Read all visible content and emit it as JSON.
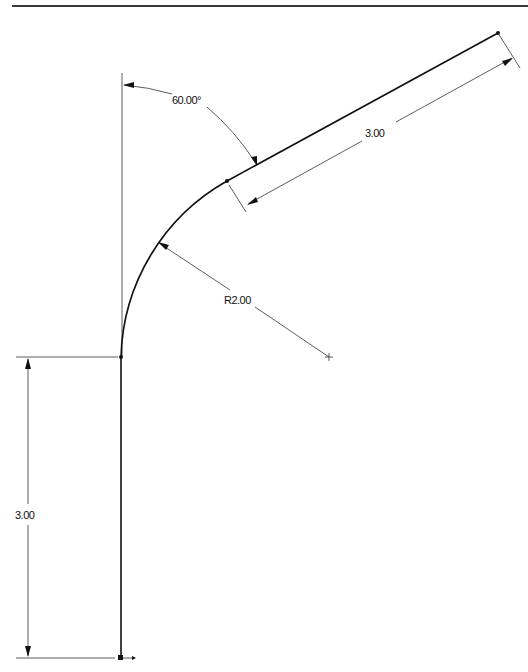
{
  "dimensions": {
    "angle_label": "60.00°",
    "straight_length_label": "3.00",
    "radius_label": "R2.00",
    "vertical_length_label": "3.00"
  },
  "geometry": {
    "vertical_segment_length": 3.0,
    "arc_radius": 2.0,
    "angle_from_vertical_deg": 60.0,
    "angled_segment_length": 3.0
  },
  "colors": {
    "line": "#111111",
    "background": "#ffffff"
  }
}
